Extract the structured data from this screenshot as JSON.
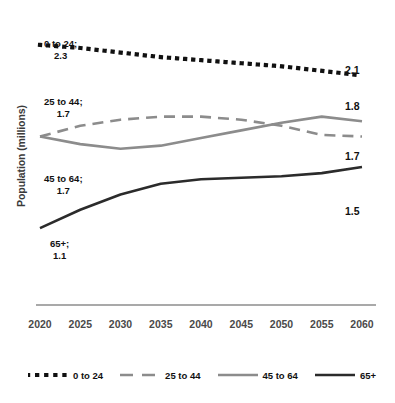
{
  "chart_data": {
    "type": "line",
    "title": "",
    "xlabel": "",
    "ylabel": "Population (millions)",
    "x": [
      2020,
      2025,
      2030,
      2035,
      2040,
      2045,
      2050,
      2055,
      2060
    ],
    "xtick_labels": [
      "2020",
      "2025",
      "2030",
      "2035",
      "2040",
      "2045",
      "2050",
      "2055",
      "2060"
    ],
    "xlim": [
      2020,
      2060
    ],
    "ylim": [
      0.95,
      2.45
    ],
    "grid": false,
    "yticks_shown": false,
    "legend_position": "bottom",
    "series": [
      {
        "name": "0 to 24",
        "style": "dotted",
        "color": "#111111",
        "values": [
          2.3,
          2.28,
          2.25,
          2.22,
          2.2,
          2.18,
          2.16,
          2.13,
          2.1
        ],
        "start_value": "2.3",
        "end_value": "2.1"
      },
      {
        "name": "25 to 44",
        "style": "dashed",
        "color": "#8c8c8c",
        "values": [
          1.7,
          1.77,
          1.81,
          1.83,
          1.83,
          1.81,
          1.77,
          1.71,
          1.7
        ],
        "start_value": "1.7",
        "end_value": "1.7"
      },
      {
        "name": "45 to 64",
        "style": "solid",
        "color": "#8c8c8c",
        "values": [
          1.7,
          1.65,
          1.62,
          1.64,
          1.69,
          1.74,
          1.79,
          1.83,
          1.8
        ],
        "start_value": "1.7",
        "end_value": "1.8"
      },
      {
        "name": "65+",
        "style": "solid",
        "color": "#2b2b2b",
        "values": [
          1.1,
          1.22,
          1.32,
          1.39,
          1.42,
          1.43,
          1.44,
          1.46,
          1.5
        ],
        "start_value": "1.1",
        "end_value": "1.5"
      }
    ],
    "annotations": [
      {
        "text": "0 to 24;",
        "value": "2.3"
      },
      {
        "text": "25 to 44;",
        "value": "1.7"
      },
      {
        "text": "45 to 64;",
        "value": "1.7"
      },
      {
        "text": "65+;",
        "value": "1.1"
      }
    ],
    "end_labels": [
      "2.1",
      "1.8",
      "1.7",
      "1.5"
    ]
  },
  "legend": {
    "items": [
      {
        "label": "0 to 24"
      },
      {
        "label": "25 to 44"
      },
      {
        "label": "45 to 64"
      },
      {
        "label": "65+"
      }
    ]
  }
}
